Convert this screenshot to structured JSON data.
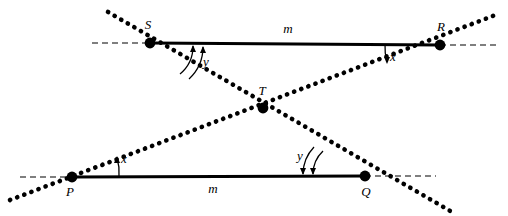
{
  "figure": {
    "type": "geometry-diagram",
    "background_color": "#ffffff",
    "stroke_color": "#000000"
  },
  "points": {
    "S": {
      "label": "S",
      "x": 150,
      "y": 43
    },
    "R": {
      "label": "R",
      "x": 440,
      "y": 45
    },
    "T": {
      "label": "T",
      "x": 263,
      "y": 108
    },
    "P": {
      "label": "P",
      "x": 72,
      "y": 177
    },
    "Q": {
      "label": "Q",
      "x": 365,
      "y": 176
    }
  },
  "lines": {
    "top_parallel": {
      "label": "m",
      "label_x": 288,
      "label_y": 33,
      "from": "S",
      "to": "R",
      "style": "solid"
    },
    "bottom_parallel": {
      "label": "m",
      "label_x": 213,
      "label_y": 193,
      "from": "P",
      "to": "Q",
      "style": "solid"
    },
    "transversal_1": {
      "style": "dotted",
      "through": [
        "S",
        "T",
        "Q"
      ]
    },
    "transversal_2": {
      "style": "dotted",
      "through": [
        "P",
        "T",
        "R"
      ]
    }
  },
  "angles": [
    {
      "label": "y",
      "vertex": "S",
      "label_x": 206,
      "label_y": 66,
      "arcs": 2
    },
    {
      "label": "x",
      "vertex": "R",
      "label_x": 393,
      "label_y": 61,
      "arcs": 1
    },
    {
      "label": "x",
      "vertex": "P",
      "label_x": 124,
      "label_y": 163,
      "arcs": 1
    },
    {
      "label": "y",
      "vertex": "Q",
      "label_x": 300,
      "label_y": 160,
      "arcs": 2
    }
  ]
}
